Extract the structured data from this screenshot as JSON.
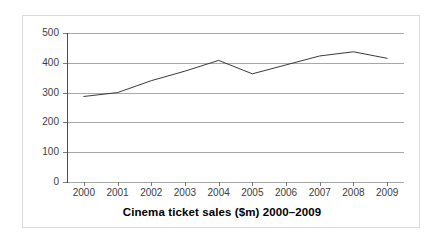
{
  "chart_data": {
    "type": "line",
    "title": "Cinema ticket sales ($m) 2000–2009",
    "xlabel": "",
    "ylabel": "",
    "categories": [
      "2000",
      "2001",
      "2002",
      "2003",
      "2004",
      "2005",
      "2006",
      "2007",
      "2008",
      "2009"
    ],
    "values": [
      287,
      300,
      340,
      372,
      408,
      363,
      393,
      423,
      437,
      415
    ],
    "series": [
      {
        "name": "Cinema ticket sales ($m)",
        "values": [
          287,
          300,
          340,
          372,
          408,
          363,
          393,
          423,
          437,
          415
        ]
      }
    ],
    "ylim": [
      0,
      500
    ],
    "yticks": [
      0,
      100,
      200,
      300,
      400,
      500
    ],
    "ytick_labels": [
      "0",
      "100",
      "200",
      "300",
      "400",
      "500"
    ],
    "xtick_labels": [
      "2000",
      "2001",
      "2002",
      "2003",
      "2004",
      "2005",
      "2006",
      "2007",
      "2008",
      "2009"
    ],
    "grid": true,
    "grid_axis": "y",
    "legend": false,
    "legend_position": "none",
    "line_color": "#3a3a3a",
    "grid_color": "#a6a6a6",
    "axis_color": "#4d4d4d",
    "background_color": "#ffffff",
    "border_color": "#d9d9d9",
    "markers": false
  }
}
